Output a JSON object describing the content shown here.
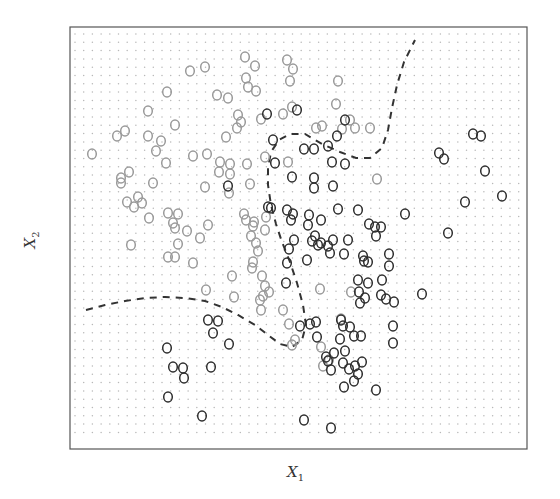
{
  "chart_data": {
    "type": "scatter",
    "title": "",
    "xlabel": "X1",
    "ylabel": "X2",
    "xlabel_main": "X",
    "xlabel_sub": "1",
    "ylabel_main": "X",
    "ylabel_sub": "2",
    "xlim": [
      0,
      1
    ],
    "ylim": [
      0,
      1
    ],
    "grid": "dotted background grid showing predicted class region",
    "legend": "none",
    "annotations": [
      "dashed line: Bayes decision boundary"
    ],
    "colors": {
      "class_gray": "#9a9a9a",
      "class_dark": "#2e2e2e",
      "boundary": "#333333",
      "frame": "#555555",
      "grid_dot": "#b8b8b8"
    },
    "frame_px": {
      "x0": 70,
      "y0": 27,
      "x1": 527,
      "y1": 449
    },
    "series": [
      {
        "name": "class-gray",
        "points_px": [
          [
            190,
            71
          ],
          [
            205,
            67
          ],
          [
            167,
            92
          ],
          [
            217,
            95
          ],
          [
            148,
            111
          ],
          [
            175,
            125
          ],
          [
            117,
            136
          ],
          [
            125,
            131
          ],
          [
            148,
            136
          ],
          [
            161,
            141
          ],
          [
            156,
            151
          ],
          [
            92,
            154
          ],
          [
            193,
            156
          ],
          [
            207,
            154
          ],
          [
            166,
            163
          ],
          [
            129,
            172
          ],
          [
            121,
            178
          ],
          [
            121,
            183
          ],
          [
            153,
            183
          ],
          [
            205,
            187
          ],
          [
            127,
            202
          ],
          [
            142,
            203
          ],
          [
            138,
            197
          ],
          [
            134,
            207
          ],
          [
            149,
            218
          ],
          [
            168,
            213
          ],
          [
            178,
            214
          ],
          [
            173,
            223
          ],
          [
            175,
            228
          ],
          [
            187,
            231
          ],
          [
            208,
            225
          ],
          [
            200,
            238
          ],
          [
            131,
            245
          ],
          [
            178,
            244
          ],
          [
            168,
            257
          ],
          [
            175,
            257
          ],
          [
            193,
            263
          ],
          [
            245,
            57
          ],
          [
            255,
            66
          ],
          [
            287,
            60
          ],
          [
            293,
            69
          ],
          [
            246,
            78
          ],
          [
            248,
            87
          ],
          [
            256,
            91
          ],
          [
            228,
            98
          ],
          [
            290,
            81
          ],
          [
            338,
            81
          ],
          [
            336,
            104
          ],
          [
            238,
            115
          ],
          [
            241,
            122
          ],
          [
            237,
            128
          ],
          [
            261,
            119
          ],
          [
            283,
            114
          ],
          [
            292,
            107
          ],
          [
            226,
            137
          ],
          [
            220,
            162
          ],
          [
            230,
            164
          ],
          [
            247,
            164
          ],
          [
            265,
            157
          ],
          [
            288,
            162
          ],
          [
            322,
            126
          ],
          [
            316,
            128
          ],
          [
            342,
            129
          ],
          [
            350,
            120
          ],
          [
            355,
            128
          ],
          [
            370,
            128
          ],
          [
            377,
            179
          ],
          [
            219,
            172
          ],
          [
            230,
            174
          ],
          [
            229,
            193
          ],
          [
            250,
            184
          ],
          [
            244,
            214
          ],
          [
            246,
            220
          ],
          [
            253,
            226
          ],
          [
            266,
            217
          ],
          [
            265,
            230
          ],
          [
            251,
            236
          ],
          [
            254,
            222
          ],
          [
            256,
            243
          ],
          [
            258,
            251
          ],
          [
            253,
            262
          ],
          [
            252,
            268
          ],
          [
            262,
            276
          ],
          [
            265,
            286
          ],
          [
            269,
            292
          ],
          [
            260,
            300
          ],
          [
            263,
            296
          ],
          [
            261,
            310
          ],
          [
            232,
            276
          ],
          [
            206,
            290
          ],
          [
            234,
            297
          ],
          [
            283,
            310
          ],
          [
            295,
            340
          ],
          [
            292,
            345
          ],
          [
            320,
            289
          ],
          [
            351,
            292
          ],
          [
            341,
            319
          ],
          [
            289,
            324
          ],
          [
            321,
            347
          ],
          [
            323,
            366
          ],
          [
            329,
            360
          ]
        ]
      },
      {
        "name": "class-dark",
        "points_px": [
          [
            267,
            114
          ],
          [
            297,
            110
          ],
          [
            273,
            140
          ],
          [
            304,
            149
          ],
          [
            314,
            149
          ],
          [
            328,
            146
          ],
          [
            337,
            136
          ],
          [
            345,
            120
          ],
          [
            275,
            163
          ],
          [
            292,
            177
          ],
          [
            314,
            178
          ],
          [
            332,
            162
          ],
          [
            345,
            164
          ],
          [
            314,
            188
          ],
          [
            333,
            186
          ],
          [
            271,
            208
          ],
          [
            287,
            210
          ],
          [
            293,
            214
          ],
          [
            309,
            215
          ],
          [
            321,
            220
          ],
          [
            338,
            209
          ],
          [
            358,
            210
          ],
          [
            291,
            220
          ],
          [
            308,
            225
          ],
          [
            369,
            224
          ],
          [
            375,
            227
          ],
          [
            381,
            227
          ],
          [
            376,
            236
          ],
          [
            228,
            186
          ],
          [
            268,
            207
          ],
          [
            294,
            240
          ],
          [
            312,
            241
          ],
          [
            315,
            236
          ],
          [
            318,
            245
          ],
          [
            333,
            240
          ],
          [
            321,
            243
          ],
          [
            328,
            246
          ],
          [
            348,
            240
          ],
          [
            289,
            249
          ],
          [
            287,
            263
          ],
          [
            307,
            260
          ],
          [
            330,
            253
          ],
          [
            344,
            254
          ],
          [
            364,
            261
          ],
          [
            368,
            262
          ],
          [
            363,
            256
          ],
          [
            389,
            254
          ],
          [
            389,
            266
          ],
          [
            382,
            280
          ],
          [
            358,
            280
          ],
          [
            368,
            283
          ],
          [
            359,
            292
          ],
          [
            360,
            303
          ],
          [
            365,
            298
          ],
          [
            381,
            295
          ],
          [
            386,
            299
          ],
          [
            394,
            302
          ],
          [
            286,
            283
          ],
          [
            473,
            134
          ],
          [
            481,
            136
          ],
          [
            439,
            153
          ],
          [
            444,
            159
          ],
          [
            485,
            171
          ],
          [
            465,
            202
          ],
          [
            502,
            196
          ],
          [
            405,
            214
          ],
          [
            448,
            233
          ],
          [
            422,
            294
          ],
          [
            393,
            326
          ],
          [
            393,
            343
          ],
          [
            300,
            326
          ],
          [
            310,
            324
          ],
          [
            316,
            322
          ],
          [
            341,
            320
          ],
          [
            343,
            326
          ],
          [
            350,
            327
          ],
          [
            354,
            336
          ],
          [
            361,
            336
          ],
          [
            340,
            339
          ],
          [
            317,
            337
          ],
          [
            345,
            351
          ],
          [
            343,
            363
          ],
          [
            328,
            361
          ],
          [
            331,
            370
          ],
          [
            334,
            353
          ],
          [
            326,
            357
          ],
          [
            349,
            369
          ],
          [
            355,
            366
          ],
          [
            358,
            374
          ],
          [
            362,
            362
          ],
          [
            354,
            381
          ],
          [
            344,
            387
          ],
          [
            376,
            390
          ],
          [
            304,
            420
          ],
          [
            331,
            428
          ],
          [
            208,
            320
          ],
          [
            218,
            321
          ],
          [
            213,
            333
          ],
          [
            229,
            344
          ],
          [
            167,
            348
          ],
          [
            173,
            367
          ],
          [
            183,
            368
          ],
          [
            211,
            367
          ],
          [
            184,
            378
          ],
          [
            168,
            397
          ],
          [
            202,
            416
          ]
        ]
      }
    ],
    "boundary_segments_px": [
      [
        [
          86,
          310
        ],
        [
          105,
          305
        ],
        [
          125,
          301
        ],
        [
          145,
          298
        ],
        [
          165,
          297
        ],
        [
          185,
          298
        ],
        [
          205,
          301
        ],
        [
          222,
          307
        ],
        [
          238,
          315
        ],
        [
          255,
          325
        ],
        [
          268,
          335
        ],
        [
          280,
          344
        ],
        [
          292,
          347
        ],
        [
          302,
          340
        ],
        [
          306,
          325
        ],
        [
          303,
          305
        ],
        [
          297,
          283
        ],
        [
          290,
          262
        ],
        [
          282,
          242
        ],
        [
          276,
          224
        ],
        [
          271,
          205
        ],
        [
          268,
          185
        ],
        [
          268,
          168
        ],
        [
          271,
          152
        ],
        [
          279,
          140
        ],
        [
          290,
          134
        ],
        [
          305,
          134
        ],
        [
          322,
          144
        ],
        [
          340,
          152
        ],
        [
          356,
          158
        ],
        [
          370,
          158
        ],
        [
          382,
          148
        ],
        [
          388,
          130
        ],
        [
          392,
          108
        ],
        [
          397,
          85
        ],
        [
          404,
          62
        ],
        [
          415,
          40
        ]
      ]
    ]
  }
}
